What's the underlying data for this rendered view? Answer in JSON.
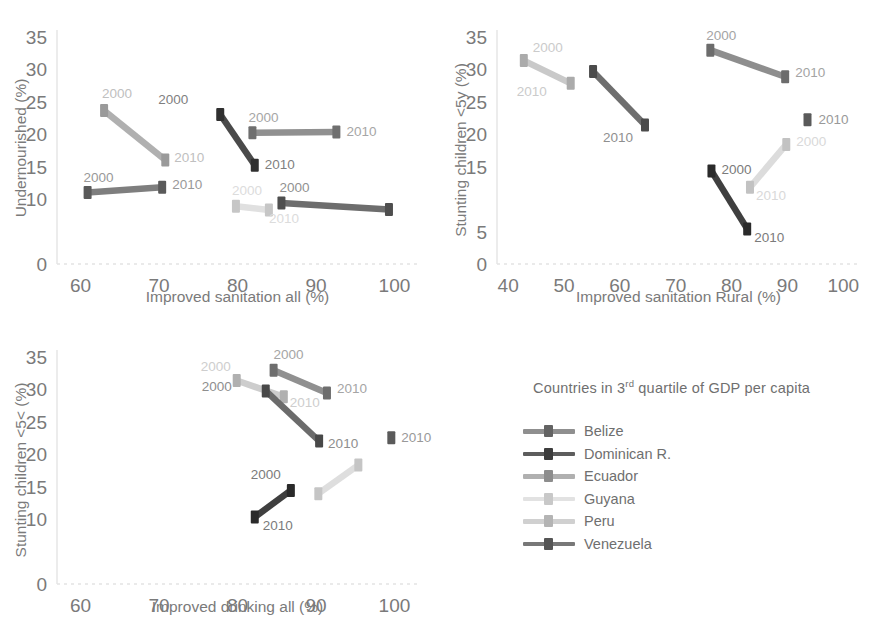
{
  "legend": {
    "title_main": "Countries in 3",
    "title_sup": "rd",
    "title_rest": " quartile of GDP per capita",
    "title_full": "Countries in 3rd quartile of GDP per capita",
    "items": [
      {
        "label": "Belize",
        "color": "#8f8f8f",
        "dot": "#636363"
      },
      {
        "label": "Dominican R.",
        "color": "#5d5d5d",
        "dot": "#3d3d3d"
      },
      {
        "label": "Ecuador",
        "color": "#b0b0b0",
        "dot": "#8d8d8d"
      },
      {
        "label": "Guyana",
        "color": "#e2e2e2",
        "dot": "#c8c8c8"
      },
      {
        "label": "Peru",
        "color": "#d0d0d0",
        "dot": "#b4b4b4"
      },
      {
        "label": "Venezuela",
        "color": "#787878",
        "dot": "#555555"
      }
    ]
  },
  "chart_data": [
    {
      "id": "undernourished-vs-sanitation-all",
      "type": "line",
      "title": "",
      "xlabel": "Improved sanitation all (%)",
      "ylabel": "Undernourished (%)",
      "xlim": [
        57,
        103
      ],
      "ylim": [
        0,
        36
      ],
      "xticks": [
        60,
        70,
        80,
        90,
        100
      ],
      "yticks": [
        0,
        10,
        15,
        20,
        25,
        30,
        35
      ],
      "grid": false,
      "series": [
        {
          "name": "Ecuador",
          "color": "#b0b0b0",
          "dot": "#9a9a9a",
          "points": [
            {
              "x": 63.0,
              "y": 23.6,
              "label": "2000",
              "lx": -2,
              "ly": -13
            },
            {
              "x": 70.8,
              "y": 16.0,
              "label": "2010",
              "lx": 9,
              "ly": 2
            }
          ]
        },
        {
          "name": "Dominican R.",
          "color": "#4a4a4a",
          "dot": "#303030",
          "points": [
            {
              "x": 77.8,
              "y": 23.0,
              "label": "2000",
              "lx": -32,
              "ly": -11
            },
            {
              "x": 82.2,
              "y": 15.2,
              "label": "2010",
              "lx": 10,
              "ly": 4
            }
          ]
        },
        {
          "name": "Belize",
          "color": "#909090",
          "dot": "#6f6f6f",
          "points": [
            {
              "x": 81.9,
              "y": 20.2,
              "label": "2000",
              "lx": -4,
              "ly": -11
            },
            {
              "x": 92.6,
              "y": 20.3,
              "label": "2010",
              "lx": 10,
              "ly": 4
            }
          ]
        },
        {
          "name": "Venezuela",
          "color": "#7e7e7e",
          "dot": "#5a5a5a",
          "points": [
            {
              "x": 60.9,
              "y": 11.0,
              "label": "2000",
              "lx": -4,
              "ly": -11
            },
            {
              "x": 70.4,
              "y": 11.8,
              "label": "2010",
              "lx": 10,
              "ly": 2
            }
          ]
        },
        {
          "name": "Guyana",
          "color": "#e0e0e0",
          "dot": "#c6c6c6",
          "points": [
            {
              "x": 79.8,
              "y": 8.9,
              "label": "2000",
              "lx": -4,
              "ly": -11
            },
            {
              "x": 84.0,
              "y": 8.3,
              "label": "2010",
              "lx": 0,
              "ly": 13
            }
          ]
        },
        {
          "name": "Peru",
          "color": "#6d6d6d",
          "dot": "#4e4e4e",
          "points": [
            {
              "x": 85.6,
              "y": 9.4,
              "label": "2000",
              "lx": -2,
              "ly": -11
            },
            {
              "x": 99.3,
              "y": 8.4,
              "label": "",
              "lx": 0,
              "ly": 0
            }
          ]
        }
      ]
    },
    {
      "id": "stunting-vs-sanitation-rural",
      "type": "line",
      "title": "",
      "xlabel": "Improved sanitation Rural (%)",
      "ylabel": "Stunting children <5y (%)",
      "xlim": [
        38,
        103
      ],
      "ylim": [
        0,
        36
      ],
      "xticks": [
        40,
        50,
        60,
        70,
        80,
        90,
        100
      ],
      "yticks": [
        0,
        5,
        15,
        20,
        25,
        30,
        35
      ],
      "grid": false,
      "series": [
        {
          "name": "Ecuador",
          "color": "#c9c9c9",
          "dot": "#ababab",
          "points": [
            {
              "x": 42.8,
              "y": 31.3,
              "label": "2000",
              "lx": 9,
              "ly": -9
            },
            {
              "x": 51.2,
              "y": 27.8,
              "label": "2010",
              "lx": -24,
              "ly": 13
            }
          ]
        },
        {
          "name": "Venezuela",
          "color": "#6e6e6e",
          "dot": "#4b4b4b",
          "points": [
            {
              "x": 55.2,
              "y": 29.6,
              "label": "",
              "lx": 0,
              "ly": 0
            },
            {
              "x": 64.5,
              "y": 21.4,
              "label": "2010",
              "lx": -12,
              "ly": 17
            }
          ]
        },
        {
          "name": "Belize",
          "color": "#8e8e8e",
          "dot": "#6c6c6c",
          "points": [
            {
              "x": 76.2,
              "y": 32.9,
              "label": "2000",
              "lx": -4,
              "ly": -10
            },
            {
              "x": 89.6,
              "y": 28.8,
              "label": "2010",
              "lx": 10,
              "ly": 0
            }
          ]
        },
        {
          "name": "Dominican R.",
          "color": "#3f3f3f",
          "dot": "#2a2a2a",
          "points": [
            {
              "x": 76.4,
              "y": 14.3,
              "label": "2000",
              "lx": 10,
              "ly": 3
            },
            {
              "x": 82.8,
              "y": 5.4,
              "label": "2010",
              "lx": 7,
              "ly": 13
            }
          ]
        },
        {
          "name": "Guyana",
          "color": "#dcdcdc",
          "dot": "#c2c2c2",
          "points": [
            {
              "x": 83.3,
              "y": 11.8,
              "label": "2010",
              "lx": 6,
              "ly": 13
            },
            {
              "x": 89.8,
              "y": 18.4,
              "label": "2000",
              "lx": 10,
              "ly": 2
            }
          ]
        },
        {
          "name": "Peru",
          "color": "#6d6d6d",
          "dot": "#5a5a5a",
          "isolated": true,
          "points": [
            {
              "x": 93.6,
              "y": 22.2,
              "label": "2010",
              "lx": 11,
              "ly": 4
            }
          ]
        }
      ]
    },
    {
      "id": "stunting-vs-drinking-all",
      "type": "line",
      "title": "",
      "xlabel": "Improved drinking all (%)",
      "ylabel": "Stunting children <5< (%)",
      "xlim": [
        57,
        103
      ],
      "ylim": [
        0,
        36
      ],
      "xticks": [
        60,
        70,
        80,
        90,
        100
      ],
      "yticks": [
        0,
        10,
        15,
        20,
        25,
        30,
        35
      ],
      "grid": false,
      "series": [
        {
          "name": "Ecuador",
          "color": "#cdcdcd",
          "dot": "#b0b0b0",
          "points": [
            {
              "x": 79.9,
              "y": 31.3,
              "label": "2000",
              "lx": -6,
              "ly": -10
            },
            {
              "x": 85.9,
              "y": 28.8,
              "label": "2010",
              "lx": 6,
              "ly": 10
            }
          ]
        },
        {
          "name": "Belize",
          "color": "#909090",
          "dot": "#6e6e6e",
          "points": [
            {
              "x": 84.6,
              "y": 32.9,
              "label": "2000",
              "lx": 0,
              "ly": -11
            },
            {
              "x": 91.4,
              "y": 29.4,
              "label": "2010",
              "lx": 10,
              "ly": 0
            }
          ]
        },
        {
          "name": "Venezuela",
          "color": "#6b6b6b",
          "dot": "#484848",
          "points": [
            {
              "x": 83.6,
              "y": 29.7,
              "label": "2000",
              "lx": -34,
              "ly": 0
            },
            {
              "x": 90.4,
              "y": 22.0,
              "label": "2010",
              "lx": 9,
              "ly": 7
            }
          ]
        },
        {
          "name": "Dominican R.",
          "color": "#3f3f3f",
          "dot": "#2a2a2a",
          "points": [
            {
              "x": 86.8,
              "y": 14.4,
              "label": "2000",
              "lx": -10,
              "ly": -11
            },
            {
              "x": 82.2,
              "y": 10.3,
              "label": "2010",
              "lx": 8,
              "ly": 13
            }
          ]
        },
        {
          "name": "Guyana",
          "color": "#dedede",
          "dot": "#c5c5c5",
          "points": [
            {
              "x": 90.3,
              "y": 13.9,
              "label": "",
              "lx": 0,
              "ly": 0
            },
            {
              "x": 95.4,
              "y": 18.3,
              "label": "",
              "lx": 0,
              "ly": 0
            }
          ]
        },
        {
          "name": "Peru",
          "color": "#6d6d6d",
          "dot": "#5a5a5a",
          "isolated": true,
          "points": [
            {
              "x": 99.6,
              "y": 22.5,
              "label": "2010",
              "lx": 10,
              "ly": 4
            }
          ]
        }
      ]
    }
  ]
}
